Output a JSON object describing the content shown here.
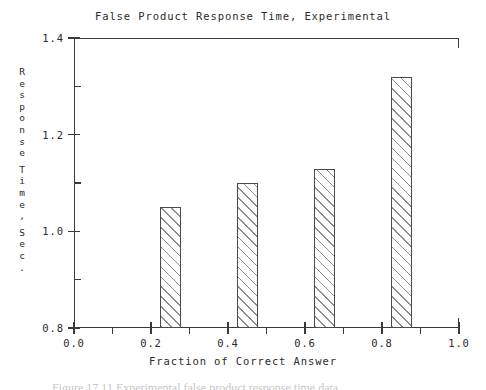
{
  "chart_data": {
    "type": "bar",
    "title": "False Product Response Time, Experimental",
    "xlabel": "Fraction of Correct Answer",
    "ylabel": "Response Time, Sec.",
    "ylabel_chars": [
      "R",
      "e",
      "s",
      "p",
      "o",
      "n",
      "s",
      "e",
      "",
      "T",
      "i",
      "m",
      "e",
      ",",
      "",
      "S",
      "e",
      "c",
      "."
    ],
    "categories": [
      "0.25",
      "0.45",
      "0.65",
      "0.85"
    ],
    "x": [
      0.25,
      0.45,
      0.65,
      0.85
    ],
    "values": [
      1.05,
      1.1,
      1.13,
      1.32
    ],
    "bar_width": 0.055,
    "xlim": [
      0.0,
      1.0
    ],
    "ylim": [
      0.8,
      1.4
    ],
    "xticks": [
      "0.0",
      "0.2",
      "0.4",
      "0.6",
      "0.8",
      "1.0"
    ],
    "xtick_values": [
      0.0,
      0.2,
      0.4,
      0.6,
      0.8,
      1.0
    ],
    "xminor_values": [
      0.1,
      0.3,
      0.5,
      0.7,
      0.9
    ],
    "yticks": [
      "0.8",
      "1.0",
      "1.2",
      "1.4"
    ],
    "ytick_values": [
      0.8,
      1.0,
      1.2,
      1.4
    ],
    "yminor_values": [
      0.9,
      1.1,
      1.3
    ],
    "grid": false,
    "legend": null,
    "bar_style": {
      "fill": "diagonal-hatch",
      "edge_color": "#4a4a4a",
      "face_color": "#ffffff",
      "hatch_color": "#787878"
    }
  },
  "caption_fragment": "Figure 17.11  Experimental false product response time data."
}
